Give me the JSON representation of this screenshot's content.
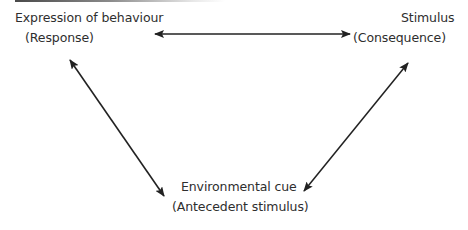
{
  "diagram": {
    "type": "triangular bidirectional relationship diagram",
    "nodes": {
      "response": {
        "title": "Expression of behaviour",
        "subtitle": "(Response)"
      },
      "consequence": {
        "title": "Stimulus",
        "subtitle": "(Consequence)"
      },
      "antecedent": {
        "title": "Environmental cue",
        "subtitle": "(Antecedent stimulus)"
      }
    },
    "edges": [
      {
        "from": "response",
        "to": "consequence",
        "style": "double-headed-arrow"
      },
      {
        "from": "response",
        "to": "antecedent",
        "style": "double-headed-arrow"
      },
      {
        "from": "consequence",
        "to": "antecedent",
        "style": "double-headed-arrow"
      }
    ],
    "colors": {
      "text": "#2e2e2e",
      "arrow": "#222222",
      "background": "#ffffff"
    }
  }
}
